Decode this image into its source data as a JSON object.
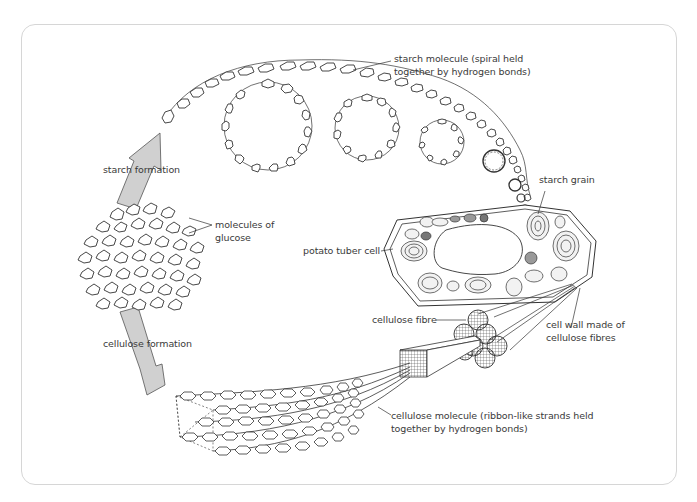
{
  "diagram": {
    "labels": {
      "starch_molecule_1": "starch molecule (spiral held",
      "starch_molecule_2": "together by hydrogen bonds)",
      "starch_formation": "starch formation",
      "molecules_of_glucose_1": "molecules of",
      "molecules_of_glucose_2": "glucose",
      "starch_grain": "starch grain",
      "potato_tuber_cell": "potato tuber cell",
      "cellulose_formation": "cellulose formation",
      "cellulose_fibre": "cellulose fibre",
      "cell_wall_1": "cell wall made of",
      "cell_wall_2": "cellulose fibres",
      "cellulose_molecule_1": "cellulose molecule (ribbon-like strands held",
      "cellulose_molecule_2": "together by hydrogen bonds)"
    },
    "colors": {
      "line": "#333333",
      "arrow_fill": "#d0d0d0",
      "frame_border": "#d6d6d6",
      "text": "#3a3a3a"
    }
  }
}
